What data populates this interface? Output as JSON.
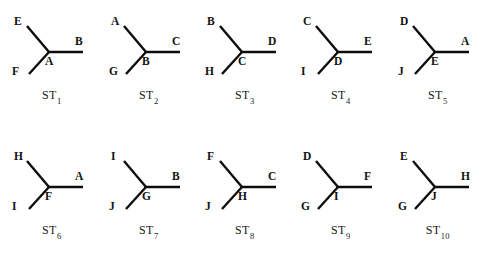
{
  "figure": {
    "background_color": "#ffffff",
    "line_color": "#0d0d0d",
    "text_color": "#111111",
    "rows": 2,
    "columns": 5,
    "shape_type": "tripod-y-graph",
    "structures": [
      {
        "caption_prefix": "ST",
        "caption_index": "1",
        "upper_left": "E",
        "lower_left": "F",
        "right": "B",
        "center": "A"
      },
      {
        "caption_prefix": "ST",
        "caption_index": "2",
        "upper_left": "A",
        "lower_left": "G",
        "right": "C",
        "center": "B"
      },
      {
        "caption_prefix": "ST",
        "caption_index": "3",
        "upper_left": "B",
        "lower_left": "H",
        "right": "D",
        "center": "C"
      },
      {
        "caption_prefix": "ST",
        "caption_index": "4",
        "upper_left": "C",
        "lower_left": "I",
        "right": "E",
        "center": "D"
      },
      {
        "caption_prefix": "ST",
        "caption_index": "5",
        "upper_left": "D",
        "lower_left": "J",
        "right": "A",
        "center": "E"
      },
      {
        "caption_prefix": "ST",
        "caption_index": "6",
        "upper_left": "H",
        "lower_left": "I",
        "right": "A",
        "center": "F"
      },
      {
        "caption_prefix": "ST",
        "caption_index": "7",
        "upper_left": "I",
        "lower_left": "J",
        "right": "B",
        "center": "G"
      },
      {
        "caption_prefix": "ST",
        "caption_index": "8",
        "upper_left": "F",
        "lower_left": "J",
        "right": "C",
        "center": "H"
      },
      {
        "caption_prefix": "ST",
        "caption_index": "9",
        "upper_left": "D",
        "lower_left": "G",
        "right": "F",
        "center": "I"
      },
      {
        "caption_prefix": "ST",
        "caption_index": "10",
        "upper_left": "E",
        "lower_left": "G",
        "right": "H",
        "center": "J"
      }
    ]
  }
}
